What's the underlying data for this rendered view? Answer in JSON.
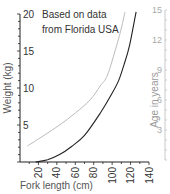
{
  "chart_data": {
    "type": "line",
    "title": "",
    "annotation": [
      "Based on data",
      "from Florida USA"
    ],
    "xlabel": "Fork length (cm)",
    "ylabel": "Weight (kg)",
    "y2label": "Age in years",
    "xlim": [
      0,
      140
    ],
    "ylim": [
      0,
      20
    ],
    "y2lim": [
      0,
      15
    ],
    "x_ticks": [
      20,
      40,
      60,
      80,
      100,
      120,
      140
    ],
    "y_ticks": [
      5,
      10,
      15,
      20
    ],
    "y2_ticks": [
      3,
      6,
      9,
      12,
      15
    ],
    "grid": false,
    "legend": null,
    "series": [
      {
        "name": "Weight",
        "axis": "left",
        "color": "#222222",
        "x": [
          17,
          30,
          43,
          56,
          70,
          87,
          100,
          107,
          113,
          119,
          126
        ],
        "values": [
          0,
          0.3,
          1,
          2.1,
          3.6,
          6.6,
          9.3,
          11,
          13.2,
          15.8,
          20.3
        ]
      },
      {
        "name": "Age",
        "axis": "right",
        "color": "#bbbbbb",
        "x": [
          8,
          25,
          43,
          60,
          76,
          87,
          95,
          105,
          110,
          114
        ],
        "values": [
          1.4,
          2.4,
          3.5,
          4.7,
          6,
          7.4,
          8.5,
          11.5,
          13.2,
          14.8
        ]
      }
    ]
  }
}
